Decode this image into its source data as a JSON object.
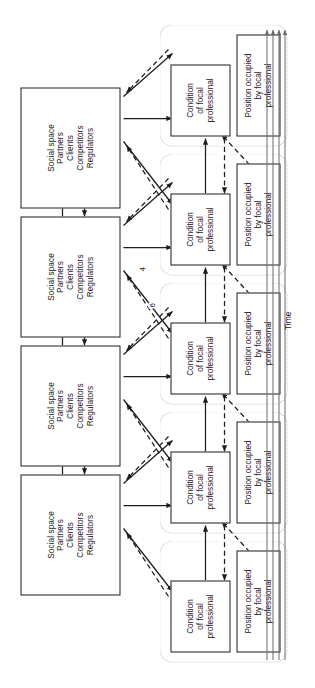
{
  "figure": {
    "type": "process-diagram",
    "orientation": "rotated-90-counterclockwise",
    "background_color": "#ffffff",
    "line_color": "#1d1d1d",
    "group_border_color": "#b9b9b9"
  },
  "social_space_boxes": [
    {
      "id": "social-1",
      "lines": [
        "Social space",
        "Partners",
        "Clients",
        "Competitors",
        "Regulators"
      ]
    },
    {
      "id": "social-2",
      "lines": [
        "Social space",
        "Partners",
        "Clients",
        "Competitors",
        "Regulators"
      ]
    },
    {
      "id": "social-3",
      "lines": [
        "Social space",
        "Partners",
        "Clients",
        "Competitors",
        "Regulators"
      ]
    },
    {
      "id": "social-4",
      "lines": [
        "Social space",
        "Partners",
        "Clients",
        "Competitors",
        "Regulators"
      ]
    }
  ],
  "stage_groups": [
    {
      "id": "stage-1",
      "condition": {
        "lines": [
          "Condition",
          "of focal",
          "professional"
        ]
      },
      "position": {
        "lines": [
          "Position occupied",
          "by focal",
          "professional"
        ]
      }
    },
    {
      "id": "stage-2",
      "condition": {
        "lines": [
          "Condition",
          "of focal",
          "professional"
        ]
      },
      "position": {
        "lines": [
          "Position occupied",
          "by focal",
          "professional"
        ]
      }
    },
    {
      "id": "stage-3",
      "condition": {
        "lines": [
          "Condition",
          "of focal",
          "professional"
        ]
      },
      "position": {
        "lines": [
          "Position occupied",
          "by focal",
          "professional"
        ]
      }
    },
    {
      "id": "stage-4",
      "condition": {
        "lines": [
          "Condition",
          "of focal",
          "professional"
        ]
      },
      "position": {
        "lines": [
          "Position occupied",
          "by focal",
          "professional"
        ]
      }
    },
    {
      "id": "stage-5",
      "condition": {
        "lines": [
          "Condition",
          "of focal",
          "professional"
        ]
      },
      "position": {
        "lines": [
          "Position occupied",
          "by focal",
          "professional"
        ]
      }
    }
  ],
  "edge_labels": [
    {
      "id": "edge-label-4",
      "text": "4"
    },
    {
      "id": "edge-label-6",
      "text": "6"
    }
  ],
  "time_axis": {
    "label": "Time",
    "line_count": 4,
    "arrow_direction": "up"
  }
}
